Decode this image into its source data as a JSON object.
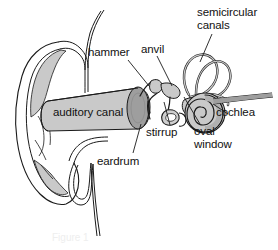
{
  "figure": {
    "type": "labeled-anatomical-diagram",
    "background_color": "#ffffff",
    "outline_color": "#1a1a1a",
    "fill_light": "#d6d6d6",
    "fill_mid": "#b9b9b9",
    "fill_dark": "#9a9a9a",
    "text_color": "#111111",
    "caption_ghost": "Figure 1"
  },
  "labels": [
    {
      "id": "semicircular-canals",
      "text": "semicircular\ncanals",
      "x": 197,
      "y": 8,
      "align": "left",
      "leader": true
    },
    {
      "id": "hammer",
      "text": "hammer",
      "x": 88,
      "y": 48,
      "align": "left",
      "leader": true
    },
    {
      "id": "anvil",
      "text": "anvil",
      "x": 141,
      "y": 45,
      "align": "left",
      "leader": true
    },
    {
      "id": "auditory-canal",
      "text": "auditory canal",
      "x": 53,
      "y": 109,
      "align": "left",
      "leader": false
    },
    {
      "id": "cochlea",
      "text": "cochlea",
      "x": 216,
      "y": 108,
      "align": "left",
      "leader": true
    },
    {
      "id": "stirrup",
      "text": "stirrup",
      "x": 146,
      "y": 128,
      "align": "left",
      "leader": true
    },
    {
      "id": "oval-window",
      "text": "oval\nwindow",
      "x": 194,
      "y": 127,
      "align": "left",
      "leader": true
    },
    {
      "id": "eardrum",
      "text": "eardrum",
      "x": 97,
      "y": 157,
      "align": "left",
      "leader": true
    }
  ],
  "parts": [
    {
      "id": "pinna",
      "name": "outer ear (pinna)"
    },
    {
      "id": "ear-canal-tube",
      "name": "auditory canal tube"
    },
    {
      "id": "eardrum-disc",
      "name": "eardrum membrane"
    },
    {
      "id": "malleus",
      "name": "hammer bone"
    },
    {
      "id": "incus",
      "name": "anvil bone"
    },
    {
      "id": "stapes",
      "name": "stirrup bone"
    },
    {
      "id": "oval-window-shape",
      "name": "oval window"
    },
    {
      "id": "semicircular-canal-loops",
      "name": "semicircular canals"
    },
    {
      "id": "cochlea-spiral",
      "name": "cochlea"
    },
    {
      "id": "eustachian-tube",
      "name": "eustachian tube"
    },
    {
      "id": "auditory-nerve",
      "name": "auditory nerve"
    }
  ]
}
